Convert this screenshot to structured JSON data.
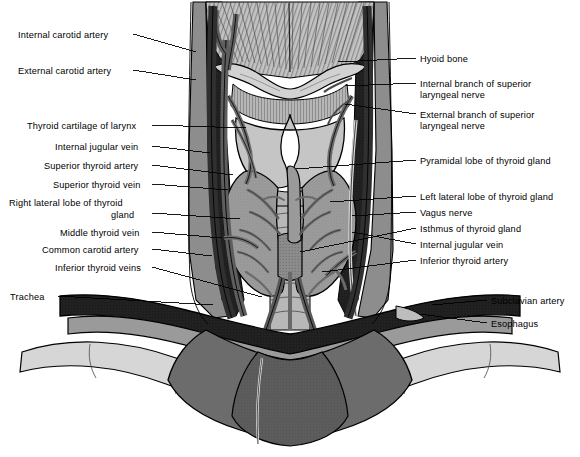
{
  "figure": {
    "background_color": "#ffffff",
    "ink_color": "#000000",
    "palette": {
      "bone_light": "#d0d0d0",
      "cartilage": "#b9b9b9",
      "gland_gray": "#9d9d9d",
      "muscle_mid": "#8a8a8a",
      "muscle_dark": "#6f6f6f",
      "vessel_dark": "#5e5e5e",
      "vein_black": "#262626",
      "deep_black": "#111111",
      "highlight": "#e8e8e8"
    }
  },
  "labels_left": [
    {
      "id": "internal-carotid-artery",
      "text": "Internal carotid artery",
      "x": 18,
      "y": 30,
      "leader": [
        [
          133,
          34
        ],
        [
          196,
          52
        ]
      ]
    },
    {
      "id": "external-carotid-artery",
      "text": "External carotid artery",
      "x": 18,
      "y": 66,
      "leader": [
        [
          133,
          70
        ],
        [
          196,
          80
        ]
      ]
    },
    {
      "id": "thyroid-cartilage-of-larynx",
      "text": "Thyroid cartilage of larynx",
      "x": 27,
      "y": 121,
      "leader": [
        [
          152,
          125
        ],
        [
          246,
          128
        ]
      ]
    },
    {
      "id": "internal-jugular-vein-left",
      "text": "Internal jugular vein",
      "x": 55,
      "y": 142,
      "leader": [
        [
          152,
          146
        ],
        [
          210,
          153
        ]
      ]
    },
    {
      "id": "superior-thyroid-artery",
      "text": "Superior thyroid artery",
      "x": 44,
      "y": 161,
      "leader": [
        [
          152,
          165
        ],
        [
          233,
          175
        ]
      ]
    },
    {
      "id": "superior-thyroid-vein",
      "text": "Superior thyroid vein",
      "x": 53,
      "y": 180,
      "leader": [
        [
          152,
          184
        ],
        [
          228,
          190
        ]
      ]
    },
    {
      "id": "right-lateral-lobe-line1",
      "text": "Right lateral lobe of thyroid",
      "x": 9,
      "y": 198,
      "leader": null
    },
    {
      "id": "right-lateral-lobe-line2",
      "text": "gland",
      "x": 111,
      "y": 210,
      "leader": [
        [
          152,
          213
        ],
        [
          240,
          219
        ]
      ]
    },
    {
      "id": "middle-thyroid-vein",
      "text": "Middle thyroid vein",
      "x": 60,
      "y": 228,
      "leader": [
        [
          152,
          232
        ],
        [
          222,
          238
        ]
      ]
    },
    {
      "id": "common-carotid-artery",
      "text": "Common carotid artery",
      "x": 42,
      "y": 245,
      "leader": [
        [
          152,
          249
        ],
        [
          212,
          256
        ]
      ]
    },
    {
      "id": "inferior-thyroid-veins",
      "text": "Inferior thyroid veins",
      "x": 55,
      "y": 263,
      "leader": [
        [
          152,
          267
        ],
        [
          262,
          297
        ]
      ]
    },
    {
      "id": "trachea",
      "text": "Trachea",
      "x": 10,
      "y": 292,
      "leader": [
        [
          58,
          296
        ],
        [
          213,
          305
        ]
      ]
    }
  ],
  "labels_right": [
    {
      "id": "hyoid-bone",
      "text": "Hyoid bone",
      "x": 420,
      "y": 54,
      "leader": [
        [
          416,
          58
        ],
        [
          338,
          62
        ]
      ]
    },
    {
      "id": "internal-branch-sln-line1",
      "text": "Internal branch of superior",
      "x": 420,
      "y": 79,
      "leader": [
        [
          416,
          83
        ],
        [
          346,
          86
        ]
      ]
    },
    {
      "id": "internal-branch-sln-line2",
      "text": "laryngeal nerve",
      "x": 420,
      "y": 90,
      "leader": null
    },
    {
      "id": "external-branch-sln-line1",
      "text": "External branch of superior",
      "x": 420,
      "y": 110,
      "leader": [
        [
          416,
          114
        ],
        [
          345,
          104
        ]
      ]
    },
    {
      "id": "external-branch-sln-line2",
      "text": "laryngeal nerve",
      "x": 420,
      "y": 121,
      "leader": null
    },
    {
      "id": "pyramidal-lobe-of-thyroid-gland",
      "text": "Pyramidal lobe of thyroid gland",
      "x": 420,
      "y": 156,
      "leader": [
        [
          416,
          160
        ],
        [
          296,
          169
        ]
      ]
    },
    {
      "id": "left-lateral-lobe-of-thyroid-gland",
      "text": "Left lateral lobe of thyroid gland",
      "x": 420,
      "y": 192,
      "leader": [
        [
          416,
          196
        ],
        [
          330,
          202
        ]
      ]
    },
    {
      "id": "vagus-nerve",
      "text": "Vagus nerve",
      "x": 420,
      "y": 208,
      "leader": [
        [
          416,
          212
        ],
        [
          352,
          216
        ]
      ]
    },
    {
      "id": "isthmus-of-thyroid-gland",
      "text": "Isthmus of thyroid gland",
      "x": 420,
      "y": 224,
      "leader": [
        [
          416,
          228
        ],
        [
          300,
          252
        ]
      ]
    },
    {
      "id": "internal-jugular-vein-right",
      "text": "Internal jugular vein",
      "x": 420,
      "y": 240,
      "leader": [
        [
          416,
          244
        ],
        [
          352,
          232
        ]
      ]
    },
    {
      "id": "inferior-thyroid-artery",
      "text": "Inferior thyroid artery",
      "x": 420,
      "y": 256,
      "leader": [
        [
          416,
          260
        ],
        [
          322,
          272
        ]
      ]
    },
    {
      "id": "subclavian-artery",
      "text": "Subclavian artery",
      "x": 491,
      "y": 296,
      "leader": [
        [
          487,
          300
        ],
        [
          432,
          305
        ]
      ]
    },
    {
      "id": "esophagus",
      "text": "Esophagus",
      "x": 491,
      "y": 319,
      "leader": [
        [
          487,
          323
        ],
        [
          420,
          314
        ]
      ]
    }
  ]
}
